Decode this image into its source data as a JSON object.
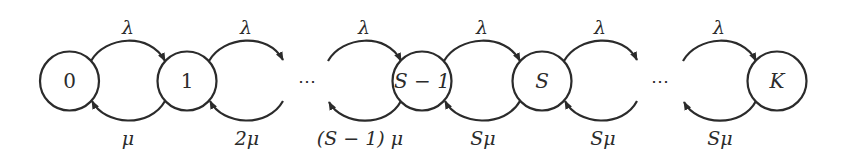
{
  "diagram": {
    "type": "birth-death Markov chain",
    "states": [
      {
        "id": "s0",
        "label": "0",
        "italic": false
      },
      {
        "id": "s1",
        "label": "1",
        "italic": false
      },
      {
        "id": "sS1",
        "label": "S − 1",
        "italic": true
      },
      {
        "id": "sS",
        "label": "S",
        "italic": true
      },
      {
        "id": "sK",
        "label": "K",
        "italic": true
      }
    ],
    "ellipsis": [
      "⋯",
      "⋯"
    ],
    "forward_rates": [
      "λ",
      "λ",
      "λ",
      "λ",
      "λ",
      "λ"
    ],
    "backward_rates": [
      "μ",
      "2μ",
      "(S − 1) μ",
      "Sμ",
      "Sμ",
      "Sμ"
    ],
    "colors": {
      "stroke": "#2b2b2b",
      "background": "#ffffff"
    }
  }
}
